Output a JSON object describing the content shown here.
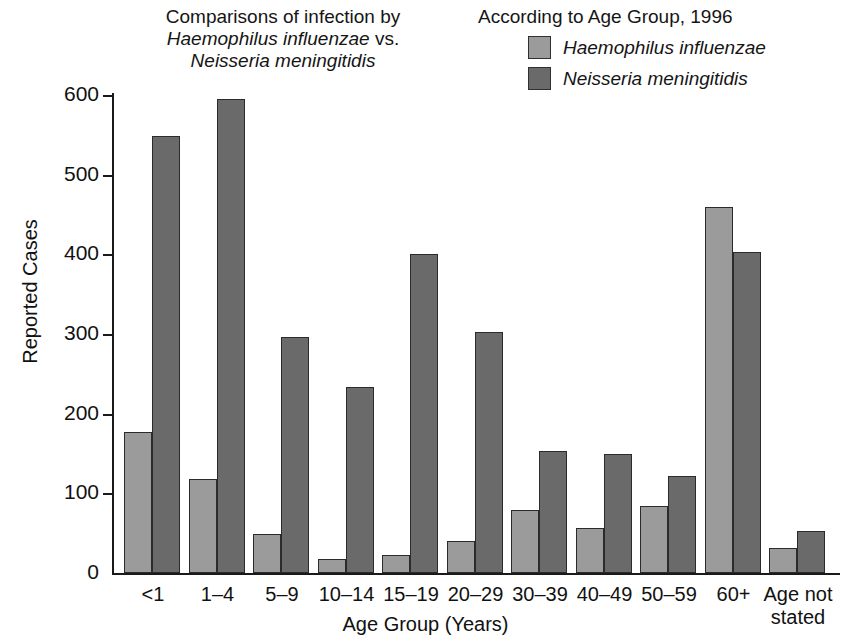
{
  "title": {
    "line1": "Comparisons of infection by",
    "line2_italic": "Haemophilus influenzae",
    "line2_rest": " vs.",
    "line3_italic": "Neisseria meningitidis"
  },
  "legend": {
    "heading": "According to Age Group, 1996",
    "entries": [
      {
        "label": "Haemophilus influenzae",
        "color": "#9b9b9b"
      },
      {
        "label": "Neisseria meningitidis",
        "color": "#6a6a6a"
      }
    ]
  },
  "axes": {
    "ylabel": "Reported Cases",
    "xlabel": "Age Group (Years)",
    "yticks": [
      "0",
      "100",
      "200",
      "300",
      "400",
      "500",
      "600"
    ]
  },
  "chart_data": {
    "type": "bar",
    "xlabel": "Age Group (Years)",
    "ylabel": "Reported Cases",
    "ylim": [
      0,
      600
    ],
    "ytick_values": [
      0,
      100,
      200,
      300,
      400,
      500,
      600
    ],
    "grid": false,
    "legend_position": "top-right",
    "categories": [
      "<1",
      "1–4",
      "5–9",
      "10–14",
      "15–19",
      "20–29",
      "30–39",
      "40–49",
      "50–59",
      "60+",
      "Age not\nstated"
    ],
    "series": [
      {
        "name": "Haemophilus influenzae",
        "color": "#9b9b9b",
        "values": [
          177,
          118,
          49,
          17,
          23,
          40,
          79,
          56,
          84,
          459,
          31
        ]
      },
      {
        "name": "Neisseria meningitidis",
        "color": "#6a6a6a",
        "values": [
          548,
          595,
          296,
          234,
          401,
          303,
          153,
          150,
          122,
          403,
          53
        ]
      }
    ]
  }
}
